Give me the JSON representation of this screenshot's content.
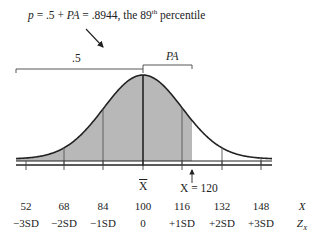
{
  "annotation": {
    "p_label": "p",
    "equation_middle": " = .5 + ",
    "pa_label": "PA",
    "equation_value": " = .8944, the 89",
    "superscript": "th",
    "suffix": " percentile"
  },
  "brackets": {
    "left_label": ".5",
    "right_label": "PA"
  },
  "markers": {
    "mean_label": "X",
    "score_label": "X = 120"
  },
  "axis_rows": {
    "x_values": [
      "52",
      "68",
      "84",
      "100",
      "116",
      "132",
      "148"
    ],
    "x_row_label": "X",
    "z_values": [
      "−3SD",
      "−2SD",
      "−1SD",
      "0",
      "+1SD",
      "+2SD",
      "+3SD"
    ],
    "z_row_label": "Z",
    "z_row_subscript": "X"
  },
  "colors": {
    "shade": "#b8b8b8",
    "line": "#222222"
  }
}
